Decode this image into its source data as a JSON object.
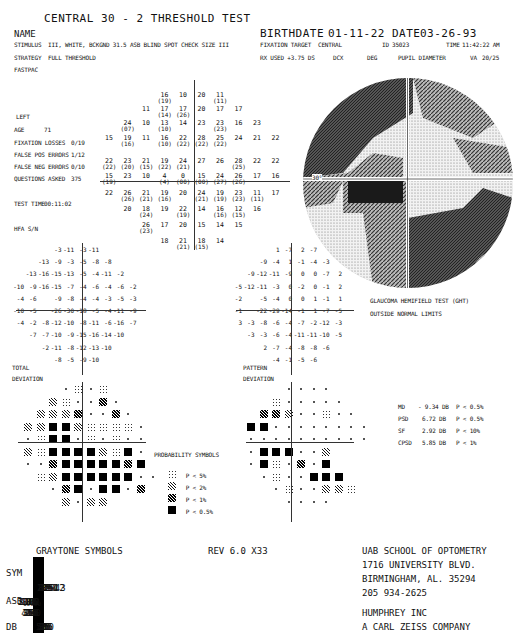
{
  "header": {
    "title": "CENTRAL 30 - 2 THRESHOLD TEST",
    "name_label": "NAME",
    "stimulus_label": "STIMULUS",
    "stimulus_value": "III, WHITE, BCKGND 31.5 ASB  BLIND SPOT CHECK SIZE  III",
    "strategy_label": "STRATEGY",
    "strategy_value": "FULL THRESHOLD",
    "fastpac_label": "FASTPAC",
    "birthdate_label": "BIRTHDATE",
    "birthdate": "01-11-22",
    "date_label": "DATE",
    "date": "03-26-93",
    "fixation_target_label": "FIXATION TARGET",
    "fixation_target": "CENTRAL",
    "id_label": "ID",
    "id": "35023",
    "time_label": "TIME",
    "time": "11:42:22 AM",
    "rx_label": "RX USED +3.75 DS",
    "dcx_label": "DCX",
    "deg_label": "DEG",
    "pupil_label": "PUPIL DIAMETER",
    "va_label": "VA",
    "va": "20/25"
  },
  "patient": {
    "eye": "LEFT",
    "age_label": "AGE",
    "age": "71",
    "fixation_losses_label": "FIXATION LOSSES",
    "fixation_losses": "0/19",
    "false_pos_label": "FALSE POS ERRORS",
    "false_pos": "1/12",
    "false_neg_label": "FALSE NEG ERRORS",
    "false_neg": "0/10",
    "questions_label": "QUESTIONS ASKED",
    "questions": "375",
    "test_time_label": "TEST TIME",
    "test_time": "00:11:02",
    "hfa_label": "HFA S/N"
  },
  "threshold_grid": {
    "rows": [
      [
        [
          "16",
          "(19)"
        ],
        [
          "10",
          ""
        ],
        [
          "20",
          ""
        ],
        [
          "11",
          "(11)"
        ]
      ],
      [
        [
          "11",
          ""
        ],
        [
          "17",
          "(14)"
        ],
        [
          "17",
          "(26)"
        ],
        [
          "20",
          ""
        ],
        [
          "17",
          ""
        ],
        [
          "17",
          ""
        ]
      ],
      [
        [
          "24",
          "(07)"
        ],
        [
          "10",
          ""
        ],
        [
          "13",
          "(10)"
        ],
        [
          "14",
          ""
        ],
        [
          "23",
          ""
        ],
        [
          "23",
          "(23)"
        ],
        [
          "16",
          ""
        ],
        [
          "23",
          ""
        ]
      ],
      [
        [
          "15",
          ""
        ],
        [
          "19",
          "(16)"
        ],
        [
          "11",
          ""
        ],
        [
          "16",
          "(10)"
        ],
        [
          "22",
          "(22)"
        ],
        [
          "28",
          "(22)"
        ],
        [
          "25",
          "(22)"
        ],
        [
          "24",
          ""
        ],
        [
          "21",
          ""
        ],
        [
          "22",
          ""
        ]
      ],
      [
        [
          "22",
          "(22)"
        ],
        [
          "23",
          "(20)"
        ],
        [
          "21",
          "(15)"
        ],
        [
          "19",
          "(22)"
        ],
        [
          "24",
          "(21)"
        ],
        [
          "27",
          ""
        ],
        [
          "26",
          ""
        ],
        [
          "28",
          "(25)"
        ],
        [
          "22",
          ""
        ],
        [
          "22",
          ""
        ]
      ],
      [
        [
          "15",
          "(19)"
        ],
        [
          "23",
          ""
        ],
        [
          "10",
          ""
        ],
        [
          "4",
          "(4)"
        ],
        [
          "0",
          "(00)"
        ],
        [
          "15",
          "(00)"
        ],
        [
          "24",
          "(27)"
        ],
        [
          "26",
          "(26)"
        ],
        [
          "17",
          ""
        ],
        [
          "16",
          ""
        ]
      ],
      [
        [
          "22",
          ""
        ],
        [
          "26",
          "(26)"
        ],
        [
          "21",
          "(21)"
        ],
        [
          "19",
          "(16)"
        ],
        [
          "20",
          ""
        ],
        [
          "24",
          "(21)"
        ],
        [
          "19",
          "(19)"
        ],
        [
          "23",
          "(23)"
        ],
        [
          "11",
          "(11)"
        ],
        [
          "17",
          ""
        ]
      ],
      [
        [
          "20",
          ""
        ],
        [
          "18",
          "(24)"
        ],
        [
          "19",
          ""
        ],
        [
          "22",
          "(19)"
        ],
        [
          "14",
          ""
        ],
        [
          "16",
          "(16)"
        ],
        [
          "12",
          "(15)"
        ],
        [
          "16",
          ""
        ]
      ],
      [
        [
          "26",
          "(23)"
        ],
        [
          "17",
          ""
        ],
        [
          "20",
          ""
        ],
        [
          "15",
          ""
        ],
        [
          "14",
          ""
        ],
        [
          "15",
          ""
        ]
      ],
      [
        [
          "18",
          ""
        ],
        [
          "21",
          "(21)"
        ],
        [
          "18",
          "(15)"
        ],
        [
          "14",
          ""
        ]
      ]
    ],
    "axis_label": "30°"
  },
  "total_deviation": {
    "label": "TOTAL",
    "label2": "DEVIATION",
    "rows": [
      [
        "-3",
        "-11",
        "-3",
        "-11"
      ],
      [
        "-13",
        "-9",
        "-3",
        "-5",
        "-8",
        "-8"
      ],
      [
        "-13",
        "-16",
        "-15",
        "-13",
        "-5",
        "-4",
        "-11",
        "-2"
      ],
      [
        "-10",
        "-9",
        "-16",
        "-15",
        "-7",
        "-4",
        "-6",
        "-4",
        "-6",
        "-2"
      ],
      [
        "-4",
        "-6",
        "",
        "-9",
        "-8",
        "-4",
        "-4",
        "-3",
        "-5",
        "-3"
      ],
      [
        "-10",
        "-5",
        "",
        "-26",
        "-30",
        "-18",
        "-5",
        "-4",
        "-11",
        "-9"
      ],
      [
        "-4",
        "-2",
        "-8",
        "-12",
        "-10",
        "-8",
        "-11",
        "-6",
        "-16",
        "-7"
      ],
      [
        "-7",
        "-7",
        "-10",
        "-9",
        "-15",
        "-16",
        "-14",
        "-10"
      ],
      [
        "-2",
        "-11",
        "-8",
        "-12",
        "-13",
        "-10"
      ],
      [
        "-8",
        "-5",
        "-9",
        "-10"
      ]
    ]
  },
  "pattern_deviation": {
    "label": "PATTERN",
    "label2": "DEVIATION",
    "rows": [
      [
        "1",
        "-7",
        "2",
        "-7"
      ],
      [
        "-9",
        "-4",
        "1",
        "-1",
        "-4",
        "-3"
      ],
      [
        "-9",
        "-12",
        "-11",
        "-9",
        "0",
        "0",
        "-7",
        "2"
      ],
      [
        "-5",
        "-12",
        "-11",
        "-3",
        "0",
        "-2",
        "0",
        "-1",
        "2"
      ],
      [
        "-2",
        "",
        "-5",
        "-4",
        "0",
        "0",
        "1",
        "-1",
        "1"
      ],
      [
        "-1",
        "",
        "-22",
        "-29",
        "-14",
        "-1",
        "1",
        "-7",
        "-5"
      ],
      [
        "3",
        "-3",
        "-8",
        "-6",
        "-4",
        "-7",
        "-2",
        "-12",
        "-3"
      ],
      [
        "-3",
        "-3",
        "-6",
        "-4",
        "-11",
        "-11",
        "-10",
        "-5"
      ],
      [
        "2",
        "-7",
        "-4",
        "-8",
        "-8",
        "-6"
      ],
      [
        "-4",
        "-1",
        "-5",
        "-6"
      ]
    ]
  },
  "ght": {
    "line1": "GLAUCOMA HEMIFIELD TEST (GHT)",
    "line2": "OUTSIDE NORMAL LIMITS"
  },
  "global_indices": [
    {
      "label": "MD",
      "value": "- 9.34 DB",
      "p": "P < 0.5%"
    },
    {
      "label": "PSD",
      "value": "6.72 DB",
      "p": "P < 0.5%"
    },
    {
      "label": "SF",
      "value": "2.92 DB",
      "p": "P <  10%"
    },
    {
      "label": "CPSD",
      "value": "5.85 DB",
      "p": "P <   1%"
    }
  ],
  "probability_symbols": {
    "title": "PROBABILITY SYMBOLS",
    "items": [
      {
        "symbol": "dots",
        "label": "P <  5%"
      },
      {
        "symbol": "sparse-hatch",
        "label": "P <  2%"
      },
      {
        "symbol": "dense-hatch",
        "label": "P <  1%"
      },
      {
        "symbol": "solid",
        "label": "P < 0.5%"
      }
    ]
  },
  "graytone": {
    "title": "GRAYTONE SYMBOLS",
    "rev": "REV 6.0   X33",
    "row_labels": [
      "SYM",
      "ASB",
      "DB"
    ],
    "asb": [
      [
        ".8",
        ".1"
      ],
      [
        "2.5",
        "1"
      ],
      [
        "8",
        "3.2"
      ],
      [
        "25",
        "10"
      ],
      [
        "79",
        "32"
      ],
      [
        "251",
        "100"
      ],
      [
        "794",
        "316"
      ],
      [
        "2512",
        "1000"
      ],
      [
        "7943",
        "3162"
      ],
      [
        "≥",
        "10000"
      ]
    ],
    "db": [
      [
        "41",
        "50"
      ],
      [
        "36",
        "40"
      ],
      [
        "31",
        "35"
      ],
      [
        "26",
        "30"
      ],
      [
        "21",
        "25"
      ],
      [
        "16",
        "20"
      ],
      [
        "11",
        "15"
      ],
      [
        "6",
        "10"
      ],
      [
        "1",
        "5"
      ],
      [
        "≤0",
        ""
      ]
    ]
  },
  "institution": {
    "line1": "UAB SCHOOL OF OPTOMETRY",
    "line2": "1716 UNIVERSITY BLVD.",
    "line3": "BIRMINGHAM, AL. 35294",
    "line4": "205   934-2625",
    "manufacturer": "HUMPHREY INC",
    "manufacturer2": "A CARL ZEISS COMPANY"
  }
}
